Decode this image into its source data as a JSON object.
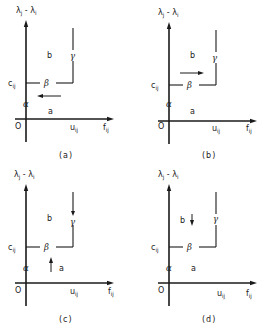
{
  "figure": {
    "y_axis_label": {
      "main": "λ",
      "sub1": "j",
      "mid": " - λ",
      "sub2": "i"
    },
    "x_axis_label": {
      "main": "f",
      "sub": "ij"
    },
    "origin_label": "O",
    "c_label": {
      "main": "c",
      "sub": "ij"
    },
    "u_label": {
      "main": "u",
      "sub": "ij"
    },
    "segment_labels": {
      "alpha": "α",
      "beta": "β",
      "gamma": "γ"
    },
    "region_labels": {
      "a": "a",
      "b": "b"
    },
    "panels": [
      {
        "id": "a",
        "caption": "(a)",
        "arrow": "left",
        "arrow_desc": "horizontal arrow pointing left, below β segment"
      },
      {
        "id": "b",
        "caption": "(b)",
        "arrow": "right",
        "arrow_desc": "horizontal arrow pointing right, above β segment"
      },
      {
        "id": "c",
        "caption": "(c)",
        "arrow": "up",
        "arrow_desc": "vertical arrow pointing up in region a; downward arrow on γ segment"
      },
      {
        "id": "d",
        "caption": "(d)",
        "arrow": "down",
        "arrow_desc": "short vertical arrow pointing down in region b"
      }
    ]
  }
}
